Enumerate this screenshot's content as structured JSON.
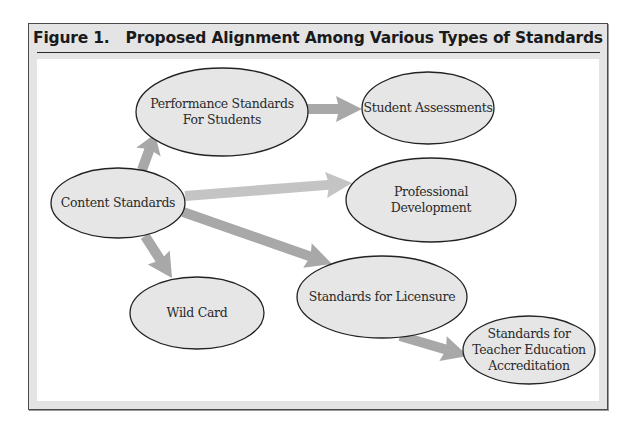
{
  "figure": {
    "number": "Figure 1.",
    "title": "Proposed Alignment Among Various Types of Standards"
  },
  "nodes": [
    {
      "id": "performance",
      "lines": [
        "Performance Standards",
        "For Students"
      ],
      "cx": 222,
      "cy": 112,
      "rx": 86,
      "ry": 44
    },
    {
      "id": "assessments",
      "lines": [
        "Student Assessments"
      ],
      "cx": 428,
      "cy": 108,
      "rx": 66,
      "ry": 36
    },
    {
      "id": "content",
      "lines": [
        "Content Standards"
      ],
      "cx": 118,
      "cy": 203,
      "rx": 67,
      "ry": 35
    },
    {
      "id": "professional",
      "lines": [
        "Professional",
        "Development"
      ],
      "cx": 431,
      "cy": 200,
      "rx": 85,
      "ry": 42
    },
    {
      "id": "wildcard",
      "lines": [
        "Wild Card"
      ],
      "cx": 197,
      "cy": 313,
      "rx": 67,
      "ry": 36
    },
    {
      "id": "licensure",
      "lines": [
        "Standards for Licensure"
      ],
      "cx": 382,
      "cy": 297,
      "rx": 85,
      "ry": 41
    },
    {
      "id": "accreditation",
      "lines": [
        "Standards for",
        "Teacher Education",
        "Accreditation"
      ],
      "cx": 529,
      "cy": 350,
      "rx": 66,
      "ry": 34
    }
  ],
  "edges": [
    {
      "from": "content",
      "to": "performance",
      "x1": 142,
      "y1": 170,
      "x2": 155,
      "y2": 134,
      "color": "#a8a8a8"
    },
    {
      "from": "performance",
      "to": "assessments",
      "x1": 306,
      "y1": 109,
      "x2": 362,
      "y2": 109,
      "color": "#a8a8a8"
    },
    {
      "from": "content",
      "to": "professional",
      "x1": 185,
      "y1": 196,
      "x2": 352,
      "y2": 183,
      "color": "#c4c4c4"
    },
    {
      "from": "content",
      "to": "licensure",
      "x1": 183,
      "y1": 212,
      "x2": 332,
      "y2": 264,
      "color": "#a8a8a8"
    },
    {
      "from": "content",
      "to": "wildcard",
      "x1": 145,
      "y1": 236,
      "x2": 172,
      "y2": 278,
      "color": "#a8a8a8"
    },
    {
      "from": "licensure",
      "to": "accreditation",
      "x1": 400,
      "y1": 336,
      "x2": 468,
      "y2": 356,
      "color": "#a8a8a8"
    }
  ],
  "colors": {
    "node_fill": "#e6e6e6",
    "node_stroke": "#222222",
    "frame_bg": "#e4e4e4"
  }
}
